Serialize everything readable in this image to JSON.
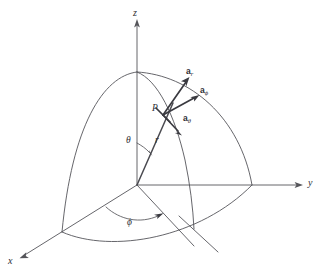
{
  "figure": {
    "background_color": "#ffffff",
    "line_color": "#55555a",
    "label_color": "#2e2e33"
  },
  "axes": [
    {
      "name": "z",
      "label": "z",
      "direction": "up"
    },
    {
      "name": "y",
      "label": "y",
      "direction": "right"
    },
    {
      "name": "x",
      "label": "x",
      "direction": "down-left"
    }
  ],
  "point": {
    "label": "P",
    "description": "point on the sphere surface"
  },
  "coordinates": [
    {
      "name": "r",
      "label": "r",
      "description": "radial distance from origin to P"
    },
    {
      "name": "theta",
      "label": "θ",
      "description": "polar angle measured from the z-axis"
    },
    {
      "name": "phi",
      "label": "ϕ",
      "description": "azimuthal angle measured from the x-axis in the xy-plane"
    }
  ],
  "unit_vectors": [
    {
      "name": "a_r",
      "base": "a",
      "subscript": "r",
      "description": "radial unit vector at P, pointing outward along r"
    },
    {
      "name": "a_phi",
      "base": "a",
      "subscript": "ϕ",
      "description": "azimuthal unit vector at P"
    },
    {
      "name": "a_theta",
      "base": "a",
      "subscript": "θ",
      "description": "polar unit vector at P"
    }
  ],
  "surfaces": [
    {
      "name": "meridian-arc-left",
      "description": "sphere octant arc from north pole to x-axis"
    },
    {
      "name": "meridian-arc-right",
      "description": "sphere octant arc from north pole to y-axis"
    },
    {
      "name": "equator-arc",
      "description": "sphere octant arc in the xy-plane from x-axis to y-axis"
    },
    {
      "name": "meridian-through-p",
      "description": "constant-phi arc passing through P"
    }
  ]
}
